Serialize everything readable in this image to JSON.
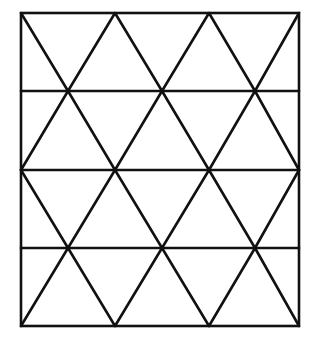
{
  "diagram": {
    "type": "triangular-grid-in-rectangle",
    "stroke_color": "#111111",
    "background_color": "#ffffff",
    "stroke_width": 2.6,
    "frame": {
      "x1": 21,
      "y1": 13,
      "x2": 299,
      "y2": 326
    },
    "rows_y": [
      13,
      91,
      170,
      248,
      326
    ],
    "even_row_x": [
      21,
      115,
      209,
      299
    ],
    "odd_row_x": [
      68,
      162,
      255
    ]
  }
}
